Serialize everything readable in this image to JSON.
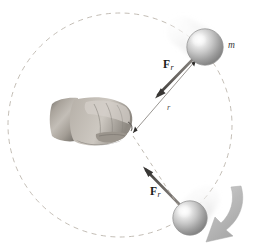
{
  "figure": {
    "background_color": "#ffffff",
    "width": 254,
    "height": 249
  },
  "colors": {
    "background": "#ffffff",
    "dashed_circle": "#b8b2a8",
    "vector_line": "#6e6a66",
    "vector_line_dark": "#3c3a38",
    "sphere_light": "#fbfbfb",
    "sphere_mid": "#b9b9b9",
    "sphere_dark": "#7c7c7c",
    "sphere_edge": "#8e8e8e",
    "motion_arrow": "#b4b4b4",
    "motion_arrow_edge": "#9a9a9a",
    "ghost_trail": "#e2e2e2",
    "hand_light": "#cbc6c0",
    "hand_mid": "#9a948d",
    "hand_dark": "#5e5a55",
    "label_text": "#1a1a1a"
  },
  "labels": {
    "force_top": {
      "symbol": "F",
      "subscript": "r"
    },
    "force_bottom": {
      "symbol": "F",
      "subscript": "r"
    },
    "radius": "r",
    "mass": "m"
  },
  "geometry": {
    "circle_center": {
      "x": 120,
      "y": 125
    },
    "circle_radius": 112,
    "hand_pivot": {
      "x": 131,
      "y": 128
    },
    "ball_top": {
      "x": 205,
      "y": 47,
      "radius": 18
    },
    "ball_bottom": {
      "x": 190,
      "y": 218,
      "radius": 17
    }
  },
  "elements": {
    "dashed_circle_name": "circular-path-dashed",
    "hand_name": "hand-fist-holding-string",
    "ball_top_name": "ball-mass-top",
    "ball_bottom_name": "ball-mass-bottom",
    "force_vector_top_name": "force-vector-centripetal-top",
    "force_vector_bottom_name": "force-vector-centripetal-bottom",
    "radius_line_name": "radius-line",
    "motion_arrow_name": "direction-of-motion-arrow"
  }
}
